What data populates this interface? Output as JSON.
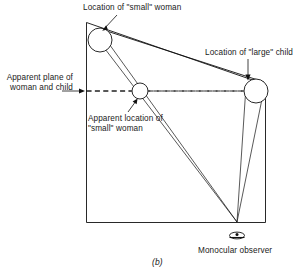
{
  "figure": {
    "caption": "(b)",
    "labels": {
      "small_woman": "Location of \"small\" woman",
      "large_child": "Location of \"large\" child",
      "apparent_plane": "Apparent plane of woman and child",
      "apparent_location": "Apparent location of \"small\" woman",
      "observer": "Monocular observer"
    },
    "colors": {
      "ink": "#111111",
      "background": "#ffffff"
    },
    "elements": {
      "room_outline": "distorted-quadrilateral-room",
      "dashed_plane": "apparent-frontal-plane",
      "circles": [
        {
          "name": "small-woman-head",
          "cx": 100,
          "cy": 40,
          "r": 12
        },
        {
          "name": "apparent-small-woman-head",
          "cx": 140,
          "cy": 91,
          "r": 8
        },
        {
          "name": "large-child-head",
          "cx": 256,
          "cy": 91,
          "r": 12
        }
      ],
      "observer_vertex": {
        "x": 237,
        "y": 222
      },
      "eye_symbol": "monocular-eye"
    }
  }
}
